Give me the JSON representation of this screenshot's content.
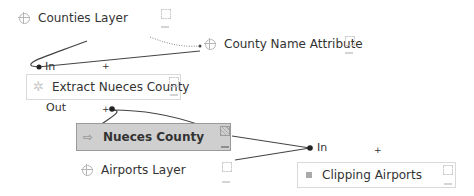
{
  "nodes": {
    "counties_layer": {
      "label": "Counties Layer",
      "icon": "layer-icon"
    },
    "county_name_attribute": {
      "label": "County Name Attribute",
      "icon": "layer-icon"
    },
    "extract_nueces_county": {
      "label": "Extract Nueces County",
      "icon": "gear-icon"
    },
    "nueces_county": {
      "label": "Nueces County",
      "icon": "arrow-icon",
      "selected": true
    },
    "airports_layer": {
      "label": "Airports Layer",
      "icon": "layer-icon"
    },
    "clipping_airports": {
      "label": "Clipping Airports",
      "icon": "clip-icon"
    }
  },
  "ports": {
    "extract_in": "In",
    "extract_out": "Out",
    "clip_in": "In",
    "plus": "+"
  },
  "colors": {
    "wire": "#444444",
    "selected_fill": "#cfcfcf",
    "box_border": "#d9d9d9"
  }
}
